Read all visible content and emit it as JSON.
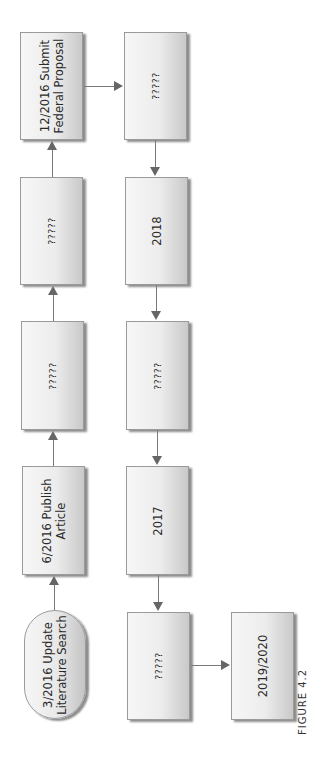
{
  "diagram": {
    "type": "flowchart",
    "orientation": "rotated-90-ccw",
    "nodes": [
      {
        "id": "n1",
        "shape": "rounded",
        "label": "3/2016 Update\nLiterature Search"
      },
      {
        "id": "n2",
        "shape": "rect",
        "label": "6/2016 Publish\nArticle"
      },
      {
        "id": "n3",
        "shape": "rect",
        "label": "?????"
      },
      {
        "id": "n4",
        "shape": "rect",
        "label": "?????"
      },
      {
        "id": "n5",
        "shape": "rect",
        "label": "12/2016 Submit\nFederal Proposal"
      },
      {
        "id": "n6",
        "shape": "rect",
        "label": "?????"
      },
      {
        "id": "n7",
        "shape": "rect",
        "label": "2018"
      },
      {
        "id": "n8",
        "shape": "rect",
        "label": "?????"
      },
      {
        "id": "n9",
        "shape": "rect",
        "label": "2017"
      },
      {
        "id": "n10",
        "shape": "rect",
        "label": "?????"
      },
      {
        "id": "n11",
        "shape": "rect",
        "label": "2019/2020"
      }
    ],
    "edges": [
      {
        "from": "n1",
        "to": "n2"
      },
      {
        "from": "n2",
        "to": "n3"
      },
      {
        "from": "n3",
        "to": "n4"
      },
      {
        "from": "n4",
        "to": "n5"
      },
      {
        "from": "n5",
        "to": "n6"
      },
      {
        "from": "n6",
        "to": "n7"
      },
      {
        "from": "n7",
        "to": "n8"
      },
      {
        "from": "n8",
        "to": "n9"
      },
      {
        "from": "n9",
        "to": "n10"
      },
      {
        "from": "n10",
        "to": "n11"
      }
    ],
    "caption": "FIGURE 4.2"
  }
}
